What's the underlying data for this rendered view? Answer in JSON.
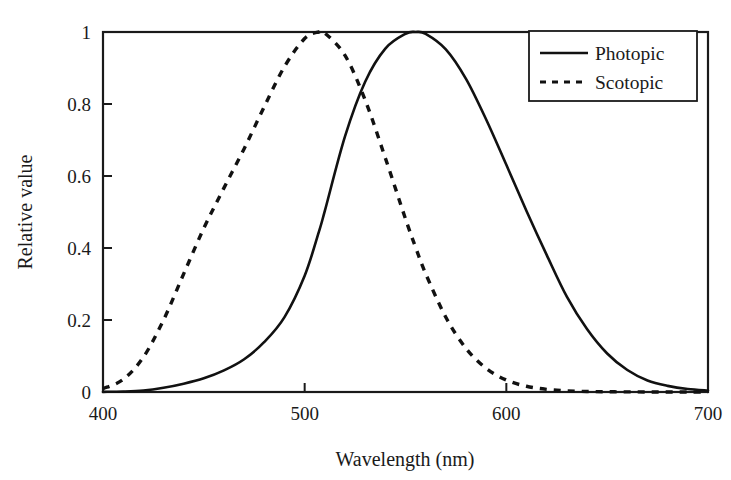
{
  "chart_data": {
    "type": "line",
    "title": "",
    "xlabel": "Wavelength (nm)",
    "ylabel": "Relative value",
    "xlim": [
      400,
      700
    ],
    "ylim": [
      0,
      1
    ],
    "xticks": [
      "400",
      "500",
      "600",
      "700"
    ],
    "xtick_values": [
      400,
      500,
      600,
      700
    ],
    "yticks": [
      "0",
      "0.2",
      "0.4",
      "0.6",
      "0.8",
      "1"
    ],
    "ytick_values": [
      0,
      0.2,
      0.4,
      0.6,
      0.8,
      1
    ],
    "grid": false,
    "legend_position": "top-right",
    "frame": "box",
    "x": [
      400,
      410,
      420,
      430,
      440,
      450,
      460,
      470,
      480,
      490,
      500,
      507,
      510,
      520,
      530,
      540,
      550,
      555,
      560,
      570,
      580,
      590,
      600,
      610,
      620,
      630,
      640,
      650,
      660,
      670,
      680,
      690,
      700
    ],
    "series": [
      {
        "name": "Photopic",
        "style": "solid",
        "color": "#111111",
        "peak_x": 555,
        "peak_y": 1.0,
        "values": [
          0.0004,
          0.0012,
          0.004,
          0.0116,
          0.023,
          0.038,
          0.06,
          0.091,
          0.139,
          0.208,
          0.323,
          0.444,
          0.503,
          0.71,
          0.862,
          0.954,
          0.995,
          1.0,
          0.995,
          0.952,
          0.87,
          0.757,
          0.631,
          0.503,
          0.381,
          0.265,
          0.175,
          0.107,
          0.061,
          0.032,
          0.017,
          0.0082,
          0.0041
        ]
      },
      {
        "name": "Scotopic",
        "style": "dashed",
        "color": "#111111",
        "peak_x": 507,
        "peak_y": 1.0,
        "values": [
          0.0093,
          0.0348,
          0.0966,
          0.1998,
          0.3281,
          0.455,
          0.567,
          0.676,
          0.793,
          0.904,
          0.982,
          1.0,
          0.997,
          0.935,
          0.811,
          0.65,
          0.481,
          0.402,
          0.3288,
          0.2076,
          0.1212,
          0.0655,
          0.03315,
          0.01593,
          0.00737,
          0.003335,
          0.001497,
          0.000677,
          0.0003129,
          0.000148,
          7.16e-05,
          3.53e-05,
          1.78e-05
        ]
      }
    ],
    "legend": [
      {
        "label": "Photopic",
        "style": "solid"
      },
      {
        "label": "Scotopic",
        "style": "dashed"
      }
    ]
  }
}
